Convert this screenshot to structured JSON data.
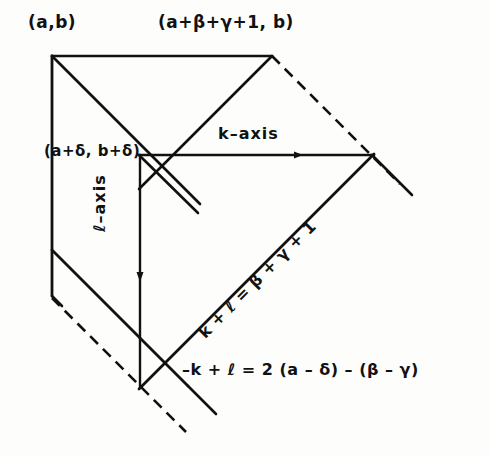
{
  "figure": {
    "type": "geometric-diagram",
    "background_color": "#fdfdfb",
    "ink_color": "#111111",
    "labels": {
      "vertex_top_left": "(a,b)",
      "vertex_top_right": "(a+β+γ+1, b)",
      "vertex_interior": "(a+δ, b+δ)",
      "k_axis": "k–axis",
      "l_axis": "ℓ–axis",
      "diagonal_equation": "k + ℓ = β + γ + 1",
      "bottom_equation": "–k + ℓ = 2 (a – δ) – (β – γ)"
    },
    "geometry": {
      "vertices": {
        "top_left": [
          52,
          56
        ],
        "top_right": [
          272,
          56
        ],
        "interior_origin": [
          140,
          155
        ],
        "k_axis_end": [
          372,
          155
        ],
        "l_axis_end": [
          140,
          385
        ],
        "left_lower": [
          52,
          296
        ]
      },
      "solid_segments": [
        [
          52,
          56,
          272,
          56
        ],
        [
          52,
          56,
          52,
          296
        ],
        [
          52,
          56,
          236,
          240
        ],
        [
          272,
          56,
          140,
          188
        ],
        [
          140,
          155,
          372,
          155
        ],
        [
          140,
          155,
          140,
          385
        ],
        [
          372,
          155,
          140,
          387
        ],
        [
          52,
          296,
          185,
          429
        ],
        [
          140,
          155,
          196,
          211
        ],
        [
          52,
          250,
          140,
          338
        ],
        [
          372,
          155,
          410,
          193
        ]
      ],
      "dashed_segments": [
        [
          272,
          56,
          398,
          182
        ],
        [
          52,
          296,
          185,
          429
        ]
      ],
      "arrow_markers": [
        {
          "name": "k-axis-arrow",
          "at": [
            300,
            155
          ],
          "direction": "right"
        },
        {
          "name": "l-axis-arrow",
          "at": [
            140,
            280
          ],
          "direction": "down"
        }
      ]
    }
  }
}
